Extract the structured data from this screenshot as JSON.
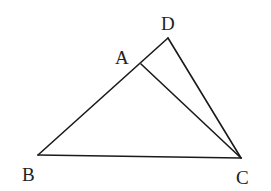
{
  "diagram": {
    "type": "geometry",
    "points": {
      "A": {
        "label": "A",
        "x": 141,
        "y": 64,
        "label_x": 117,
        "label_y": 64
      },
      "B": {
        "label": "B",
        "x": 38,
        "y": 155,
        "label_x": 22,
        "label_y": 181
      },
      "C": {
        "label": "C",
        "x": 241,
        "y": 158,
        "label_x": 236,
        "label_y": 184
      },
      "D": {
        "label": "D",
        "x": 168,
        "y": 38,
        "label_x": 161,
        "label_y": 30
      }
    },
    "segments": [
      {
        "from": "B",
        "to": "D"
      },
      {
        "from": "B",
        "to": "C"
      },
      {
        "from": "A",
        "to": "C"
      },
      {
        "from": "D",
        "to": "C"
      }
    ],
    "colors": {
      "line": "#1a1a1a",
      "label": "#222222",
      "background": "#ffffff"
    }
  }
}
